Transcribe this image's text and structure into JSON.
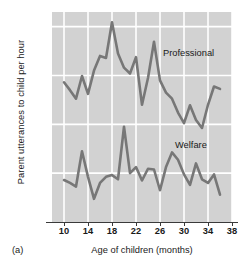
{
  "figure": {
    "panel_tag": "(a)",
    "xlabel": "Age of children (months)",
    "ylabel": "Parent utterances to child per hour"
  },
  "chart_data": {
    "type": "line",
    "title": "",
    "xlabel": "Age of children (months)",
    "ylabel": "Parent utterances to child per hour",
    "xlim": [
      8,
      38
    ],
    "ylim": [
      0,
      860
    ],
    "xticks": [
      10,
      14,
      18,
      22,
      26,
      30,
      34,
      38
    ],
    "yticks": [
      200,
      400,
      600,
      800
    ],
    "grid": true,
    "legend": "inline-annotations",
    "line_color": "#777777",
    "plot_background": "#d2d2d2",
    "gridline_color": "#ffffff",
    "series": [
      {
        "name": "Professional",
        "label_x": 26.5,
        "label_y": 690,
        "x": [
          10,
          11,
          12,
          13,
          14,
          15,
          16,
          17,
          18,
          19,
          20,
          21,
          22,
          23,
          24,
          25,
          26,
          27,
          28,
          29,
          30,
          31,
          32,
          33,
          34,
          35,
          36
        ],
        "values": [
          572,
          540,
          505,
          598,
          525,
          620,
          680,
          672,
          818,
          690,
          632,
          608,
          675,
          480,
          590,
          738,
          580,
          530,
          505,
          448,
          405,
          478,
          418,
          385,
          480,
          555,
          545
        ]
      },
      {
        "name": "Welfare",
        "label_x": 28.5,
        "label_y": 310,
        "x": [
          10,
          11,
          12,
          13,
          14,
          15,
          16,
          17,
          18,
          19,
          20,
          21,
          22,
          23,
          24,
          25,
          26,
          27,
          28,
          29,
          30,
          31,
          32,
          33,
          34,
          35,
          36
        ],
        "values": [
          172,
          160,
          145,
          290,
          185,
          95,
          160,
          185,
          192,
          175,
          390,
          200,
          225,
          170,
          218,
          215,
          130,
          225,
          285,
          255,
          195,
          152,
          240,
          175,
          160,
          195,
          112
        ]
      }
    ]
  },
  "ytick_labels": [
    "200",
    "400",
    "600",
    "800"
  ],
  "xtick_labels": [
    "10",
    "14",
    "18",
    "22",
    "26",
    "30",
    "34",
    "38"
  ]
}
